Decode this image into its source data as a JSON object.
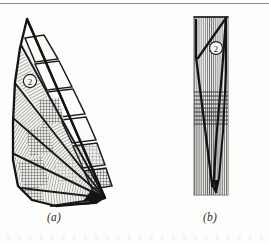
{
  "plate": {
    "name": "two-panel-line-drawing-plate",
    "background_color": "#fdfdfc",
    "ink_color": "#1a1a1a",
    "rule_color": "#8a8a88",
    "top_rule": true,
    "bottom_text_smudge": true
  },
  "panels": [
    {
      "id": "a",
      "caption": "(a)",
      "description": "fan-shaped outline with radiating hatched sectors and a band of quadrangular cells",
      "annotation_label": "2",
      "annotation_style": "circled-numeral",
      "sector_count": 7,
      "cell_count": 7,
      "apex": [
        23,
        9
      ],
      "hub": [
        101,
        188
      ]
    },
    {
      "id": "b",
      "caption": "(b)",
      "description": "narrow elongate panel filled with vertical striations, V-shaped dark axis, horizontal banding near mid-height",
      "annotation_label": "2",
      "annotation_style": "circled-numeral",
      "striation_count": 26,
      "band_line_count": 9
    }
  ],
  "labels": {
    "caption_a": "(a)",
    "caption_b": "(b)",
    "marker_a": "2",
    "marker_b": "2"
  },
  "colors": {
    "ink": "#1a1a1a",
    "hatch": "#4a4a4a",
    "light_fill": "#f2f1ee",
    "mid_fill": "#d9d7d2",
    "paper": "#fdfdfc",
    "rule": "#8a8a88"
  }
}
